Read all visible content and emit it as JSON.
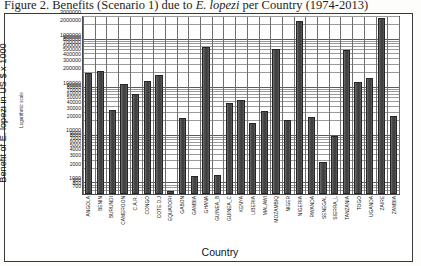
{
  "figure": {
    "title_prefix": "Figure 2. Benefits (Scenario 1) due to ",
    "title_italic": "E. lopezi",
    "title_suffix": " per Country (1974-2013)"
  },
  "axes": {
    "ytitle": "Benefit of E. lopezi in US $ x 1000",
    "ysubtitle": "Logarithmic scale",
    "xtitle": "Country"
  },
  "chart_data": {
    "type": "bar",
    "title": "Figure 2. Benefits (Scenario 1) due to E. lopezi per Country (1974-2013)",
    "xlabel": "Country",
    "ylabel": "Benefit of E. lopezi in US $ x 1000",
    "yscale": "log",
    "ynote": "Logarithmic scale",
    "ylim": [
      600,
      3000000
    ],
    "grid": true,
    "legend": "none",
    "ytick_labels": [
      "3000000",
      "2000000",
      "1000000",
      "900000",
      "800000",
      "700000",
      "600000",
      "500000",
      "400000",
      "300000",
      "200000",
      "100000",
      "90000",
      "80000",
      "70000",
      "60000",
      "50000",
      "40000",
      "30000",
      "20000",
      "10000",
      "9000",
      "8000",
      "7000",
      "6000",
      "5000",
      "4000",
      "3000",
      "2000",
      "1000",
      "900",
      "800",
      "700"
    ],
    "categories": [
      "ANGOLA",
      "BENIN",
      "BURUNDI",
      "CAMEROON",
      "C.A.R.",
      "CONGO",
      "COTE.D.J",
      "EQUATORI",
      "GABON",
      "GAMBIA",
      "GHANA",
      "GUINEA_B",
      "GUINEA_C",
      "KENYA",
      "LIBERIA",
      "MALAWI",
      "MOZAMBIQ",
      "NIGER",
      "NIGERIA",
      "RWANDA",
      "SENEGAL",
      "SIERRA_L",
      "TANZANIA",
      "TOGO",
      "UGANDA",
      "ZAIRE",
      "ZAMBIA"
    ],
    "values": [
      200000,
      220000,
      35000,
      120000,
      75000,
      140000,
      185000,
      700,
      23000,
      1400,
      700000,
      1500,
      47000,
      55000,
      18000,
      32000,
      650000,
      21000,
      2500000,
      25000,
      2800,
      10000,
      600000,
      130000,
      160000,
      2900000,
      26000
    ]
  }
}
